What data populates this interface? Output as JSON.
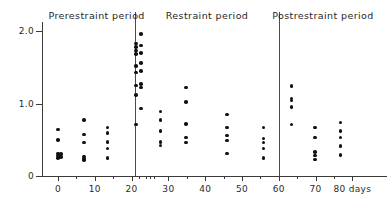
{
  "chart_data": {
    "type": "scatter",
    "title": "",
    "xlabel": "days",
    "ylabel": "",
    "xlim": [
      -5,
      85
    ],
    "ylim": [
      0,
      2.1
    ],
    "grid": false,
    "legend": "none",
    "y_ticks": [
      {
        "value": 0,
        "label": "0"
      },
      {
        "value": 1.0,
        "label": "1.0"
      },
      {
        "value": 2.0,
        "label": "2.0"
      }
    ],
    "x_ticks_major": [
      {
        "value": 0,
        "label": "0"
      },
      {
        "value": 10,
        "label": "10"
      },
      {
        "value": 20,
        "label": "20"
      },
      {
        "value": 30,
        "label": "30"
      },
      {
        "value": 40,
        "label": "40"
      },
      {
        "value": 50,
        "label": "50"
      },
      {
        "value": 60,
        "label": "60"
      },
      {
        "value": 70,
        "label": "70"
      },
      {
        "value": 80,
        "label": "80 days"
      }
    ],
    "x_ticks_minor": [
      5,
      15,
      22,
      24,
      25,
      26,
      35,
      45,
      55,
      65,
      75
    ],
    "dividers": [
      {
        "value": 21,
        "label": "prerestraint-restraint-divider"
      },
      {
        "value": 60,
        "label": "restraint-postrestraint-divider"
      }
    ],
    "period_labels": [
      {
        "text": "Prerestraint period",
        "center_x": 10.5
      },
      {
        "text": "Restraint period",
        "center_x": 40.5
      },
      {
        "text": "Postrestraint period",
        "center_x": 72.0
      }
    ],
    "points": [
      {
        "x": 0,
        "y": 0.64
      },
      {
        "x": 0,
        "y": 0.5
      },
      {
        "x": 0,
        "y": 0.31
      },
      {
        "x": 0,
        "y": 0.28
      },
      {
        "x": 0,
        "y": 0.25
      },
      {
        "x": 0.8,
        "y": 0.3
      },
      {
        "x": 0.8,
        "y": 0.26
      },
      {
        "x": 7,
        "y": 0.77
      },
      {
        "x": 7,
        "y": 0.57
      },
      {
        "x": 7,
        "y": 0.46
      },
      {
        "x": 7,
        "y": 0.27
      },
      {
        "x": 7,
        "y": 0.24
      },
      {
        "x": 7,
        "y": 0.22
      },
      {
        "x": 13.5,
        "y": 0.67
      },
      {
        "x": 13.5,
        "y": 0.59
      },
      {
        "x": 13.5,
        "y": 0.47
      },
      {
        "x": 13.5,
        "y": 0.38
      },
      {
        "x": 13.5,
        "y": 0.25
      },
      {
        "x": 21.2,
        "y": 1.83
      },
      {
        "x": 21.2,
        "y": 1.78
      },
      {
        "x": 21.2,
        "y": 1.73
      },
      {
        "x": 21.2,
        "y": 1.68
      },
      {
        "x": 21.2,
        "y": 1.52
      },
      {
        "x": 21.2,
        "y": 1.43
      },
      {
        "x": 21.2,
        "y": 1.25
      },
      {
        "x": 21.2,
        "y": 1.12
      },
      {
        "x": 21.2,
        "y": 0.71
      },
      {
        "x": 22.5,
        "y": 1.96
      },
      {
        "x": 22.5,
        "y": 1.8
      },
      {
        "x": 22.5,
        "y": 1.7
      },
      {
        "x": 22.5,
        "y": 1.56
      },
      {
        "x": 22.5,
        "y": 1.45
      },
      {
        "x": 22.5,
        "y": 1.27
      },
      {
        "x": 22.5,
        "y": 1.22
      },
      {
        "x": 22.5,
        "y": 0.93
      },
      {
        "x": 27.8,
        "y": 0.89
      },
      {
        "x": 27.8,
        "y": 0.77
      },
      {
        "x": 27.8,
        "y": 0.62
      },
      {
        "x": 27.8,
        "y": 0.47
      },
      {
        "x": 27.8,
        "y": 0.42
      },
      {
        "x": 34.8,
        "y": 1.22
      },
      {
        "x": 34.8,
        "y": 1.02
      },
      {
        "x": 34.8,
        "y": 0.72
      },
      {
        "x": 34.8,
        "y": 0.53
      },
      {
        "x": 34.8,
        "y": 0.46
      },
      {
        "x": 46,
        "y": 0.85
      },
      {
        "x": 46,
        "y": 0.67
      },
      {
        "x": 46,
        "y": 0.56
      },
      {
        "x": 46,
        "y": 0.49
      },
      {
        "x": 46,
        "y": 0.31
      },
      {
        "x": 55.8,
        "y": 0.67
      },
      {
        "x": 55.8,
        "y": 0.52
      },
      {
        "x": 55.8,
        "y": 0.46
      },
      {
        "x": 55.8,
        "y": 0.38
      },
      {
        "x": 55.8,
        "y": 0.25
      },
      {
        "x": 63.5,
        "y": 1.24
      },
      {
        "x": 63.5,
        "y": 1.07
      },
      {
        "x": 63.5,
        "y": 1.04
      },
      {
        "x": 63.5,
        "y": 0.95
      },
      {
        "x": 63.5,
        "y": 0.71
      },
      {
        "x": 69.8,
        "y": 0.67
      },
      {
        "x": 69.8,
        "y": 0.53
      },
      {
        "x": 69.8,
        "y": 0.33
      },
      {
        "x": 69.8,
        "y": 0.28
      },
      {
        "x": 69.8,
        "y": 0.23
      },
      {
        "x": 76.8,
        "y": 0.74
      },
      {
        "x": 76.8,
        "y": 0.62
      },
      {
        "x": 76.8,
        "y": 0.53
      },
      {
        "x": 76.8,
        "y": 0.41
      },
      {
        "x": 76.8,
        "y": 0.29
      }
    ]
  }
}
